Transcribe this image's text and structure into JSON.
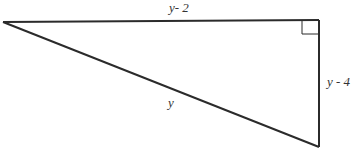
{
  "diagram": {
    "type": "right-triangle",
    "stroke_color": "#2b2b2b",
    "labels": {
      "top_side": "y- 2",
      "right_side": "y - 4",
      "hypotenuse": "y"
    },
    "right_angle_marker": "square"
  }
}
